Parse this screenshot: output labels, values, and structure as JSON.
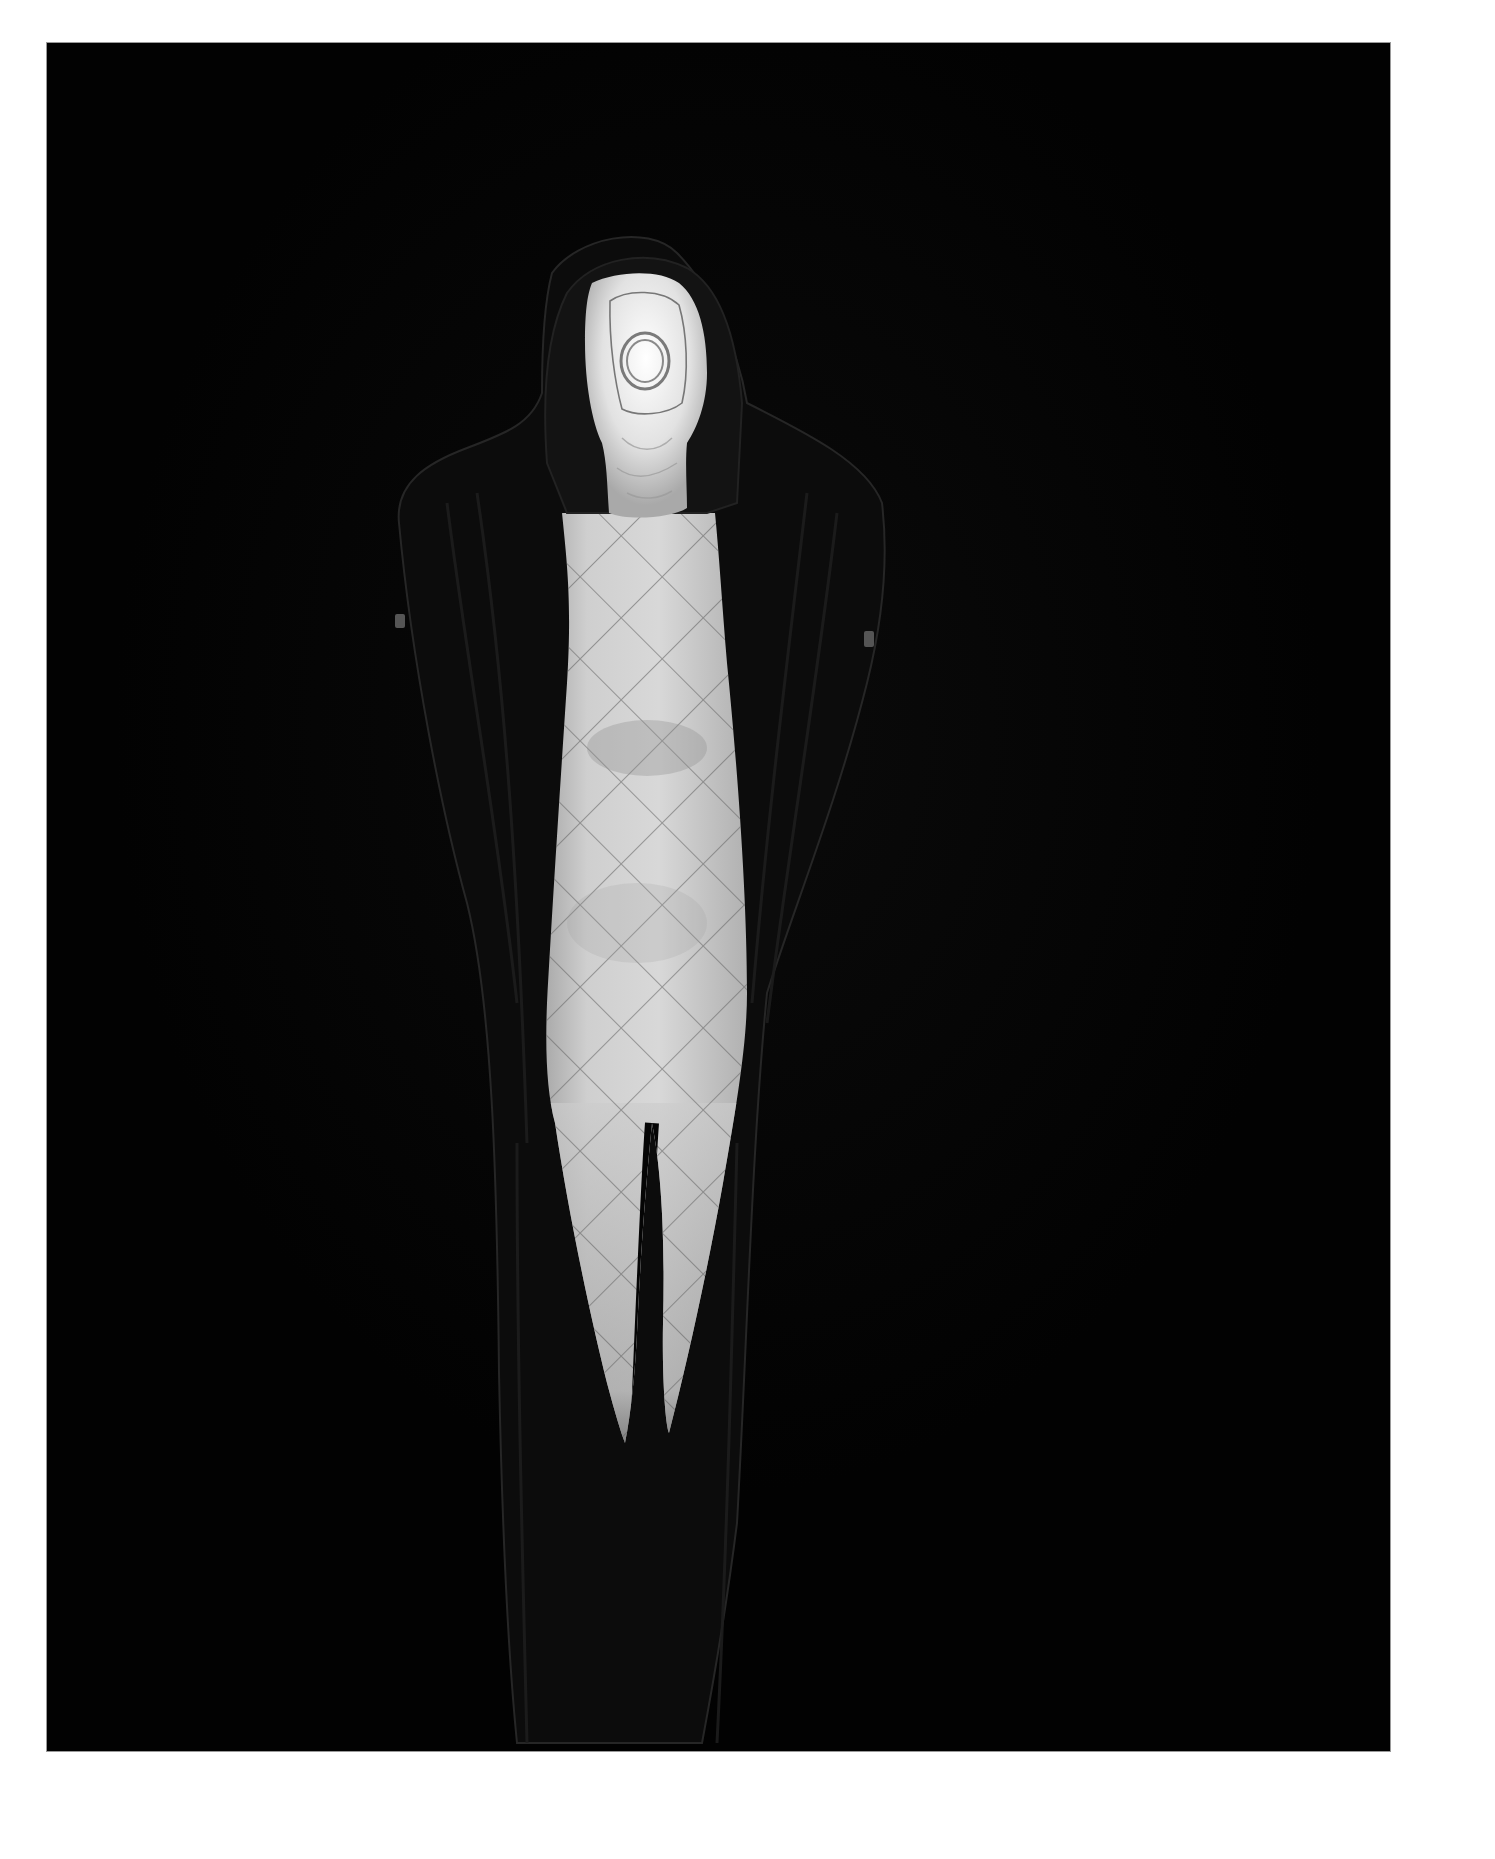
{
  "page": {
    "background_color": "#ffffff",
    "frame": {
      "x": 47,
      "y": 43,
      "width": 1343,
      "height": 1708,
      "color": "#020202"
    }
  },
  "photograph": {
    "style": "black-and-white studio photograph",
    "subject": "standing hooded figure with face covered by a white fabric mask, wearing a pale diamond-quilted bodysuit under an open dark quilted coat",
    "elements": [
      {
        "name": "hood",
        "color": "#151515"
      },
      {
        "name": "face-mask",
        "color": "#e6e6e6",
        "detail": "stitched circular ring over face and outline seam"
      },
      {
        "name": "coat",
        "color": "#0d0d0d",
        "detail": "open dark quilted coat with small tabs at each shoulder"
      },
      {
        "name": "bodysuit",
        "color": "#c9c9c9",
        "detail": "diamond quilting pattern over torso and legs"
      }
    ],
    "colors": {
      "background": "#020202",
      "coat": "#0d0d0d",
      "coat_edge": "#2a2a2a",
      "bodysuit_light": "#d4d4d4",
      "bodysuit_shadow": "#8a8a8a",
      "mask": "#e8e8e8",
      "quilt_lines": "#5a5a5a",
      "shoulder_tab": "#555555"
    }
  }
}
